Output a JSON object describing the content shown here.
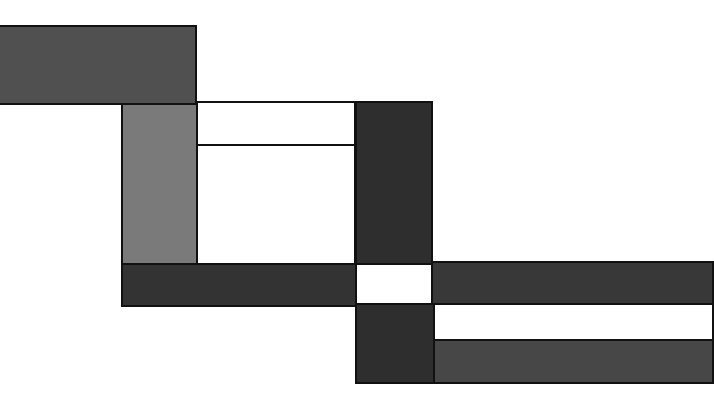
{
  "canvas": {
    "width": 712,
    "height": 412,
    "background": "#ffffff"
  },
  "blocks": [
    {
      "name": "top-left-dark-rect",
      "x": -2,
      "y": 25,
      "w": 199,
      "h": 80,
      "color": "#505050"
    },
    {
      "name": "left-gray-column",
      "x": 121,
      "y": 103,
      "w": 77,
      "h": 162,
      "color": "#7a7a7a"
    },
    {
      "name": "upper-white-panel",
      "x": 196,
      "y": 101,
      "w": 160,
      "h": 45,
      "color": "#ffffff"
    },
    {
      "name": "lower-white-panel",
      "x": 196,
      "y": 144,
      "w": 160,
      "h": 121,
      "color": "#ffffff"
    },
    {
      "name": "center-dark-column",
      "x": 355,
      "y": 101,
      "w": 78,
      "h": 164,
      "color": "#2e2e2e"
    },
    {
      "name": "left-dark-band",
      "x": 121,
      "y": 263,
      "w": 236,
      "h": 44,
      "color": "#333333"
    },
    {
      "name": "center-white-square",
      "x": 355,
      "y": 263,
      "w": 78,
      "h": 42,
      "color": "#ffffff"
    },
    {
      "name": "right-dark-band",
      "x": 431,
      "y": 261,
      "w": 283,
      "h": 44,
      "color": "#383838"
    },
    {
      "name": "lower-dark-column",
      "x": 355,
      "y": 303,
      "w": 80,
      "h": 81,
      "color": "#2e2e2e"
    },
    {
      "name": "right-white-strip",
      "x": 433,
      "y": 303,
      "w": 281,
      "h": 38,
      "color": "#ffffff"
    },
    {
      "name": "bottom-right-gray-band",
      "x": 433,
      "y": 339,
      "w": 281,
      "h": 45,
      "color": "#474747"
    }
  ]
}
